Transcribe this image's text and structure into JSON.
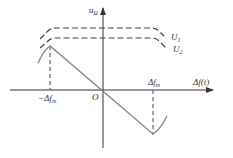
{
  "diagram": {
    "y_axis_label": "u",
    "y_axis_label_sub": "Ω",
    "x_axis_label_delta": "Δ",
    "x_axis_label": "f(t)",
    "origin_label": "O",
    "neg_tick_label_prefix": "−Δ",
    "neg_tick_label": "f",
    "neg_tick_label_sub": "m",
    "pos_tick_label_prefix": "Δ",
    "pos_tick_label": "f",
    "pos_tick_label_sub": "m",
    "threshold_labels": [
      {
        "main": "U",
        "sub": "1"
      },
      {
        "main": "U",
        "sub": "2"
      }
    ],
    "colors": {
      "axis": "#333333",
      "curve": "#8a8a8a",
      "dashed": "#444444"
    }
  }
}
